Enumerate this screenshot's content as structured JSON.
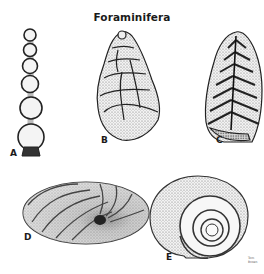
{
  "title": "Foraminifera",
  "specimens": [
    {
      "label": "A",
      "shape": "uniserial-chain"
    },
    {
      "label": "B",
      "shape": "trochospiral-conical"
    },
    {
      "label": "C",
      "shape": "biserial-chevron"
    },
    {
      "label": "D",
      "shape": "planispiral-side-view"
    },
    {
      "label": "E",
      "shape": "planispiral-coil"
    }
  ],
  "signature": "Tom Brown",
  "colors": {
    "ink": "#1a1a1a",
    "stipple": "#8a8a8a",
    "background": "#ffffff"
  }
}
